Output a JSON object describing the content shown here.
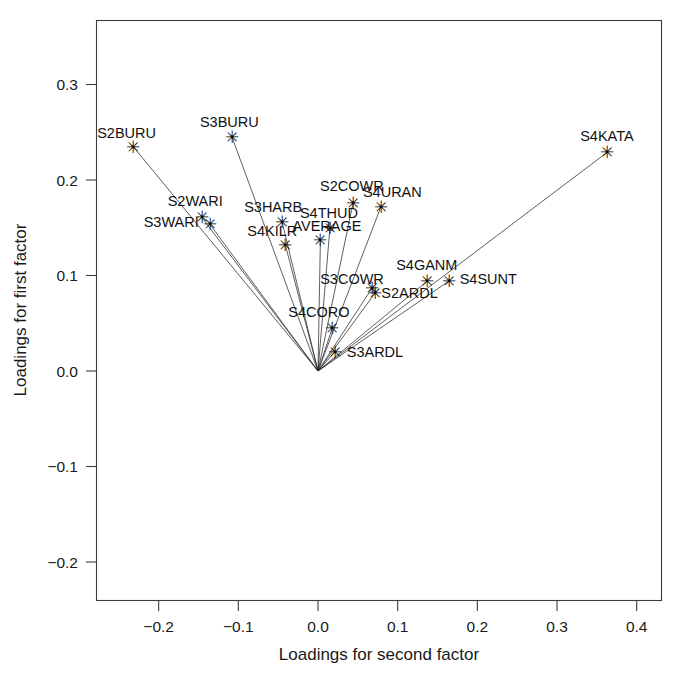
{
  "chart_data": {
    "type": "scatter",
    "title": "",
    "xlabel": "Loadings for second factor",
    "ylabel": "Loadings for first factor",
    "xlim": [
      -0.26,
      0.43
    ],
    "ylim": [
      -0.26,
      0.44
    ],
    "xticks": [
      -0.2,
      -0.1,
      0.0,
      0.1,
      0.2,
      0.3,
      0.4
    ],
    "xticklabels": [
      "−0.2",
      "−0.1",
      "0.0",
      "0.1",
      "0.2",
      "0.3",
      "0.4"
    ],
    "yticks": [
      -0.2,
      -0.1,
      0.0,
      0.1,
      0.2,
      0.3,
      0.4
    ],
    "yticklabels": [
      "−0.2",
      "−0.1",
      "0.0",
      "0.1",
      "0.2",
      "0.3",
      "0.4"
    ],
    "grid": false,
    "legend": null,
    "marker": "star",
    "origin": [
      0.0,
      0.0
    ],
    "rays_from_origin": true,
    "points": [
      {
        "label": "S2BURU",
        "x": -0.232,
        "y": 0.235,
        "label_dx": -36,
        "label_dy": -9
      },
      {
        "label": "S3BURU",
        "x": -0.108,
        "y": 0.245,
        "label_dx": -32,
        "label_dy": -10
      },
      {
        "label": "S2WARI",
        "x": -0.146,
        "y": 0.161,
        "label_dx": -34,
        "label_dy": -11
      },
      {
        "label": "S3WARI",
        "x": -0.136,
        "y": 0.154,
        "label_dx": -66,
        "label_dy": 3
      },
      {
        "label": "S3HARB",
        "x": -0.045,
        "y": 0.156,
        "label_dx": -38,
        "label_dy": -10
      },
      {
        "label": "S4KILR",
        "x": -0.041,
        "y": 0.132,
        "label_dx": -38,
        "label_dy": -9
      },
      {
        "label": "S4THUD",
        "x": 0.015,
        "y": 0.15,
        "label_dx": -30,
        "label_dy": -10
      },
      {
        "label": "AVERAGE",
        "x": 0.003,
        "y": 0.137,
        "label_dx": -28,
        "label_dy": -9
      },
      {
        "label": "S2COWR",
        "x": 0.044,
        "y": 0.176,
        "label_dx": -33,
        "label_dy": -12
      },
      {
        "label": "S4URAN",
        "x": 0.079,
        "y": 0.172,
        "label_dx": -18,
        "label_dy": -10
      },
      {
        "label": "S3COWR",
        "x": 0.068,
        "y": 0.087,
        "label_dx": -52,
        "label_dy": -4
      },
      {
        "label": "S2ARDL",
        "x": 0.072,
        "y": 0.082,
        "label_dx": 6,
        "label_dy": 5
      },
      {
        "label": "S4GANM",
        "x": 0.137,
        "y": 0.094,
        "label_dx": -31,
        "label_dy": -11
      },
      {
        "label": "S4SUNT",
        "x": 0.164,
        "y": 0.094,
        "label_dx": 11,
        "label_dy": 3
      },
      {
        "label": "S4CORO",
        "x": 0.018,
        "y": 0.045,
        "label_dx": -44,
        "label_dy": -11
      },
      {
        "label": "S3ARDL",
        "x": 0.021,
        "y": 0.02,
        "label_dx": 12,
        "label_dy": 5
      },
      {
        "label": "S4KATA",
        "x": 0.363,
        "y": 0.229,
        "label_dx": -27,
        "label_dy": -11
      }
    ]
  },
  "axes": {
    "x_title": "Loadings for second factor",
    "y_title": "Loadings for first factor"
  }
}
